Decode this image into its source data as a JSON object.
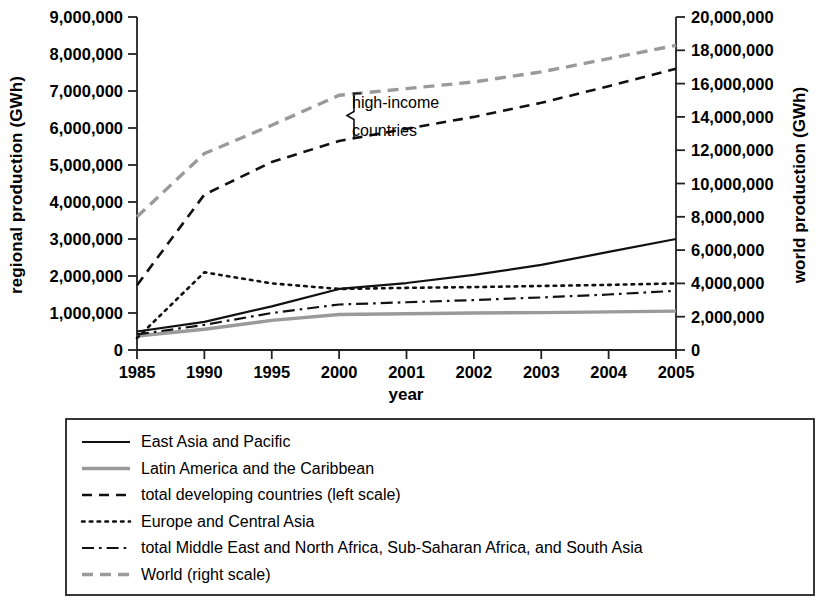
{
  "chart_data": {
    "type": "line",
    "title": "",
    "xlabel": "year",
    "ylabel": "regional production (GWh)",
    "y2label": "world production (GWh)",
    "x": [
      "1985",
      "1990",
      "1995",
      "2000",
      "2001",
      "2002",
      "2003",
      "2004",
      "2005"
    ],
    "categories": [
      "1985",
      "1990",
      "1995",
      "2000",
      "2001",
      "2002",
      "2003",
      "2004",
      "2005"
    ],
    "ylim": [
      0,
      9000000
    ],
    "y2lim": [
      0,
      20000000
    ],
    "yticks": [
      "0",
      "1,000,000",
      "2,000,000",
      "3,000,000",
      "4,000,000",
      "5,000,000",
      "6,000,000",
      "7,000,000",
      "8,000,000",
      "9,000,000"
    ],
    "y2ticks": [
      "0",
      "2,000,000",
      "4,000,000",
      "6,000,000",
      "8,000,000",
      "10,000,000",
      "12,000,000",
      "14,000,000",
      "16,000,000",
      "18,000,000",
      "20,000,000"
    ],
    "grid": false,
    "legend_position": "below",
    "annotations": [
      {
        "text": "high-income",
        "x_frac": 0.41,
        "y_value": 6750000
      },
      {
        "text": "countries",
        "x_frac": 0.41,
        "y_value": 6050000
      },
      {
        "text": "brace",
        "kind": "curly-brace",
        "spans_series": [
          "World (right scale)",
          "total developing countries (left scale)"
        ]
      }
    ],
    "series": [
      {
        "name": "East Asia and Pacific",
        "axis": "left",
        "style": "solid",
        "color": "#111111",
        "width": 2.2,
        "values": [
          500000,
          760000,
          1180000,
          1650000,
          1810000,
          2030000,
          2300000,
          2650000,
          3000000
        ]
      },
      {
        "name": "Latin America and the Caribbean",
        "axis": "left",
        "style": "solid",
        "color": "#9a9a9a",
        "width": 3.4,
        "values": [
          380000,
          560000,
          800000,
          960000,
          980000,
          1000000,
          1010000,
          1030000,
          1050000
        ]
      },
      {
        "name": "total developing countries (left scale)",
        "axis": "left",
        "style": "dashed",
        "color": "#111111",
        "width": 2.6,
        "values": [
          1750000,
          4200000,
          5080000,
          5650000,
          5980000,
          6300000,
          6680000,
          7130000,
          7600000
        ]
      },
      {
        "name": "Europe and Central Asia",
        "axis": "left",
        "style": "dotted",
        "color": "#111111",
        "width": 2.6,
        "values": [
          320000,
          2100000,
          1800000,
          1650000,
          1680000,
          1700000,
          1730000,
          1760000,
          1800000
        ]
      },
      {
        "name": "total Middle East and North Africa, Sub-Saharan Africa, and South Asia",
        "axis": "left",
        "style": "dashdot",
        "color": "#111111",
        "width": 2.2,
        "values": [
          420000,
          680000,
          1000000,
          1230000,
          1290000,
          1350000,
          1420000,
          1500000,
          1600000
        ]
      },
      {
        "name": "World (right scale)",
        "axis": "right",
        "style": "dashed",
        "color": "#9a9a9a",
        "width": 3.4,
        "values": [
          8000000,
          11800000,
          13500000,
          15300000,
          15700000,
          16100000,
          16700000,
          17500000,
          18300000
        ]
      }
    ]
  },
  "axes": {
    "left_title": "regional production (GWh)",
    "right_title": "world production (GWh)",
    "x_title": "year"
  },
  "legend": {
    "items": [
      {
        "label": "East Asia and Pacific",
        "style": "solid",
        "color": "#111111"
      },
      {
        "label": "Latin America and the Caribbean",
        "style": "solid",
        "color": "#9a9a9a"
      },
      {
        "label": "total developing countries (left scale)",
        "style": "dashed",
        "color": "#111111"
      },
      {
        "label": "Europe and Central Asia",
        "style": "dotted",
        "color": "#111111"
      },
      {
        "label": "total Middle East and North Africa, Sub-Saharan Africa, and South Asia",
        "style": "dashdot",
        "color": "#111111"
      },
      {
        "label": "World (right scale)",
        "style": "dashed",
        "color": "#9a9a9a"
      }
    ]
  },
  "annotation": {
    "line1": "high-income",
    "line2": "countries"
  }
}
